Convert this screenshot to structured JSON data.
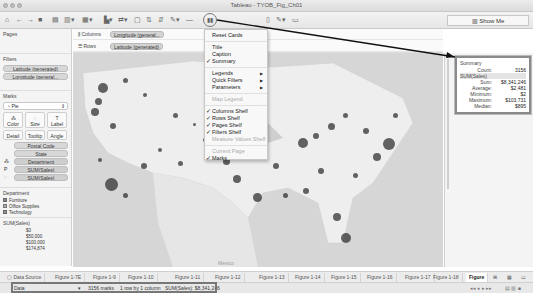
{
  "window": {
    "title": "Tableau - TYOB_Fig_Ch01"
  },
  "toolbar": {
    "show_me_label": "Show Me",
    "items": [
      "home-icon",
      "undo-icon",
      "redo-icon",
      "save-icon",
      "new-datasource-icon",
      "new-sheet-icon",
      "duplicate-icon",
      "clear-icon",
      "swap-icon",
      "sort-asc-icon",
      "sort-desc-icon",
      "group-icon",
      "label-icon",
      "fit-icon",
      "show-cards-icon",
      "presentation-icon",
      "highlight-icon",
      "tooltip-icon"
    ]
  },
  "left_panel": {
    "pages_title": "Pages",
    "filters_title": "Filters",
    "filters": [
      "Latitude (generated)",
      "Longitude (general..."
    ],
    "marks_title": "Marks",
    "mark_type": "Pie",
    "mark_buttons": [
      {
        "label": "Color",
        "icon": "color-icon"
      },
      {
        "label": "Size",
        "icon": "size-icon"
      },
      {
        "label": "Label",
        "icon": "label-icon"
      },
      {
        "label": "Detail",
        "icon": "detail-icon"
      },
      {
        "label": "Tooltip",
        "icon": "tooltip-icon"
      },
      {
        "label": "Angle",
        "icon": "angle-icon"
      }
    ],
    "mark_fields": [
      {
        "icon": "",
        "label": "Postal Code"
      },
      {
        "icon": "",
        "label": "State"
      },
      {
        "icon": "color-icon",
        "label": "Department"
      },
      {
        "icon": "P",
        "label": "SUM(Sales)"
      },
      {
        "icon": "size-icon",
        "label": "SUM(Sales)"
      }
    ],
    "legend_department": {
      "title": "Department",
      "items": [
        "Furniture",
        "Office Supplies",
        "Technology"
      ]
    },
    "legend_sales": {
      "title": "SUM(Sales)",
      "items": [
        "$0",
        "$50,000",
        "$100,000",
        "$174,874"
      ]
    }
  },
  "shelves": {
    "columns_label": "Columns",
    "columns_pill": "Longitude (general...",
    "rows_label": "Rows",
    "rows_pill": "Latitude (generated)"
  },
  "cards_menu": {
    "items": [
      {
        "label": "Reset Cards",
        "checked": false,
        "disabled": false,
        "submenu": false
      },
      {
        "sep": true
      },
      {
        "label": "Title",
        "checked": false,
        "disabled": false,
        "submenu": false
      },
      {
        "label": "Caption",
        "checked": false,
        "disabled": false,
        "submenu": false
      },
      {
        "label": "Summary",
        "checked": true,
        "disabled": false,
        "submenu": false
      },
      {
        "sep": true
      },
      {
        "label": "Legends",
        "checked": false,
        "disabled": false,
        "submenu": true
      },
      {
        "label": "Quick Filters",
        "checked": false,
        "disabled": false,
        "submenu": true
      },
      {
        "label": "Parameters",
        "checked": false,
        "disabled": false,
        "submenu": true
      },
      {
        "sep": true
      },
      {
        "label": "Map Legend",
        "checked": false,
        "disabled": true,
        "submenu": false
      },
      {
        "sep": true
      },
      {
        "label": "Columns Shelf",
        "checked": true,
        "disabled": false,
        "submenu": false
      },
      {
        "label": "Rows Shelf",
        "checked": true,
        "disabled": false,
        "submenu": false
      },
      {
        "label": "Pages Shelf",
        "checked": true,
        "disabled": false,
        "submenu": false
      },
      {
        "label": "Filters Shelf",
        "checked": true,
        "disabled": false,
        "submenu": false
      },
      {
        "label": "Measure Values Shelf",
        "checked": false,
        "disabled": true,
        "submenu": false
      },
      {
        "sep": true
      },
      {
        "label": "Current Page",
        "checked": false,
        "disabled": true,
        "submenu": false
      },
      {
        "label": "Marks",
        "checked": true,
        "disabled": false,
        "submenu": false
      }
    ]
  },
  "summary_card": {
    "title": "Summary",
    "rows": [
      {
        "key": "Count:",
        "value": "3156"
      },
      {
        "key": "SUM(Sales)",
        "value": "",
        "header": true
      },
      {
        "key": "Sum:",
        "value": "$8,341,246"
      },
      {
        "key": "Average:",
        "value": "$2,481"
      },
      {
        "key": "Minimum:",
        "value": "$2"
      },
      {
        "key": "Maximum:",
        "value": "$103,731"
      },
      {
        "key": "Median:",
        "value": "$895"
      }
    ]
  },
  "map": {
    "label_mexico": "Mexico"
  },
  "sheet_tabs": {
    "data_source": "Data Source",
    "tabs": [
      "Figure 1-7E",
      "Figure 1-9",
      "Figure 1-10",
      "Figure 1-11",
      "Figure 1-12",
      "Figure 1-13",
      "Figure 1-14",
      "Figure 1-15",
      "Figure 1-16",
      "Figure 1-17",
      "Figure 1-18",
      "Figure"
    ],
    "active_index": 11
  },
  "status_bar": {
    "sheet_select": "Data",
    "marks": "3156 marks",
    "dims": "1 row by 1 column",
    "sum": "SUM(Sales): $8,341,246"
  }
}
